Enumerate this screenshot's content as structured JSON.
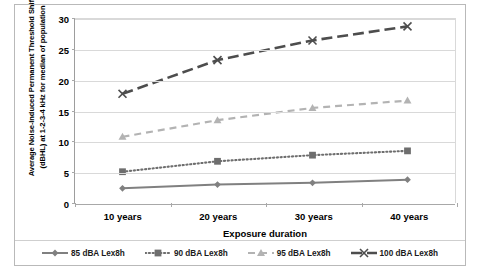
{
  "chart_data": {
    "type": "line",
    "title": "",
    "xlabel": "Exposure duration",
    "ylabel": "Average Noise-Induced Permanent Threshold Shift (dBHL) at 1-2-3-4 kHz for median of population",
    "categories": [
      "10 years",
      "20 years",
      "30 years",
      "40 years"
    ],
    "ylim": [
      0,
      30
    ],
    "yticks": [
      0,
      5,
      10,
      15,
      20,
      25,
      30
    ],
    "ytick_labels": [
      "0",
      "5",
      "10",
      "15",
      "20",
      "25",
      "30"
    ],
    "grid": true,
    "legend_position": "bottom",
    "series": [
      {
        "name": "85 dBA Lex8h",
        "values": [
          2.4,
          3.0,
          3.3,
          3.8
        ],
        "color": "#808080",
        "linestyle": "solid",
        "marker": "diamond"
      },
      {
        "name": "90 dBA Lex8h",
        "values": [
          5.1,
          6.8,
          7.8,
          8.5
        ],
        "color": "#6e6e6e",
        "linestyle": "dotted",
        "marker": "square"
      },
      {
        "name": "95 dBA Lex8h",
        "values": [
          10.8,
          13.5,
          15.5,
          16.7
        ],
        "color": "#b3b3b3",
        "linestyle": "dashed",
        "marker": "triangle"
      },
      {
        "name": "100 dBA Lex8h",
        "values": [
          17.8,
          23.3,
          26.5,
          28.8
        ],
        "color": "#4d4d4d",
        "linestyle": "long-dash",
        "marker": "cross"
      }
    ]
  },
  "axis": {
    "y_title": "Average Noise-Induced Permanent Threshold Shift (dBHL) at 1-2-3-4 kHz for median of population",
    "x_title": "Exposure duration"
  },
  "legend": {
    "items": [
      {
        "label": "85 dBA Lex8h"
      },
      {
        "label": "90 dBA Lex8h"
      },
      {
        "label": "95 dBA Lex8h"
      },
      {
        "label": "100 dBA Lex8h"
      }
    ]
  }
}
